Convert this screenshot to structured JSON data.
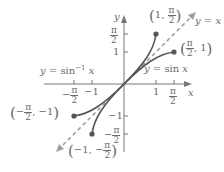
{
  "diagram": {
    "axes": {
      "x_label": "x",
      "y_label": "y"
    },
    "x_ticks": [
      {
        "label_num": "π",
        "label_den": "2",
        "neg": true,
        "value": -1.5708
      },
      {
        "label": "−1",
        "value": -1
      },
      {
        "label": "1",
        "value": 1
      },
      {
        "label_num": "π",
        "label_den": "2",
        "neg": false,
        "value": 1.5708
      }
    ],
    "y_ticks": [
      {
        "label_num": "π",
        "label_den": "2",
        "neg": false,
        "value": 1.5708
      },
      {
        "label": "1",
        "value": 1
      },
      {
        "label": "−1",
        "value": -1
      },
      {
        "label_num": "π",
        "label_den": "2",
        "neg": true,
        "value": -1.5708
      }
    ],
    "curves": [
      {
        "name": "y = sin x",
        "label": "y = sin x"
      },
      {
        "name": "y = sin^-1 x",
        "label_base": "y = sin",
        "label_sup": "−1",
        "label_var": "x"
      },
      {
        "name": "y = x",
        "label": "y = x",
        "style": "dashed"
      }
    ],
    "points": [
      {
        "label_pre": "1, ",
        "label_num": "π",
        "label_den": "2",
        "coords": [
          1,
          1.5708
        ]
      },
      {
        "label_num": "π",
        "label_den": "2",
        "label_post": ", 1",
        "coords": [
          1.5708,
          1
        ]
      },
      {
        "label_num": "π",
        "label_den": "2",
        "label_pre": "−",
        "label_post": ", −1",
        "coords": [
          -1.5708,
          -1
        ]
      },
      {
        "label_pre": "−1, −",
        "label_num": "π",
        "label_den": "2",
        "coords": [
          -1,
          -1.5708
        ]
      }
    ],
    "labels": {
      "minus": "−",
      "lparen": "(",
      "rparen": ")"
    }
  }
}
